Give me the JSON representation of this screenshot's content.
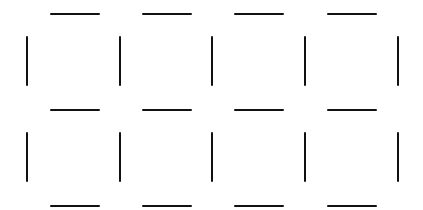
{
  "diagram": {
    "rows": 2,
    "cols": 4,
    "line_color": "#111111",
    "background": "#ffffff",
    "horizontal_x_starts": [
      50,
      142,
      234,
      327
    ],
    "horizontal_y": [
      13,
      109,
      205
    ],
    "vertical_x": [
      26,
      119,
      211,
      304,
      397
    ],
    "vertical_y_starts": [
      36,
      132
    ],
    "segment_length": 50
  }
}
